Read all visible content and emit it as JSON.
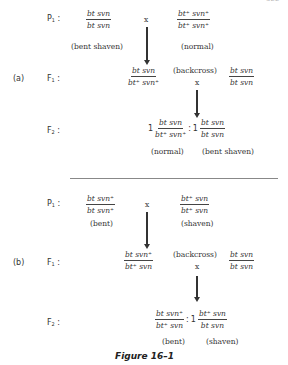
{
  "page_number": "322",
  "figure_caption": "Figure 16–1",
  "cross_a": {
    "label": "(a)",
    "P1": {
      "gen_label": "P",
      "gen_sub": "1",
      "left_parent": {
        "num": "bt svn",
        "den": "bt svn",
        "phenotype": "(bent shaven)"
      },
      "cross_symbol": "x",
      "right_parent": {
        "num": "bt⁺ svn⁺",
        "den": "bt⁺ svn⁺",
        "phenotype": "(normal)"
      }
    },
    "F1": {
      "gen_label": "F",
      "gen_sub": "1",
      "genotype": {
        "num": "bt  svn",
        "den": "bt⁺ svn⁺"
      },
      "backcross_label": "(backcross)",
      "cross_symbol": "x",
      "tester": {
        "num": "bt svn",
        "den": "bt svn"
      }
    },
    "F2": {
      "gen_label": "F",
      "gen_sub": "2",
      "ratio_left": "1",
      "left": {
        "num": "bt  svn",
        "den": "bt⁺ svn⁺",
        "phenotype": "(normal)"
      },
      "colon": ":",
      "ratio_right": "1",
      "right": {
        "num": "bt svn",
        "den": "bt svn",
        "phenotype": "(bent shaven)"
      }
    }
  },
  "cross_b": {
    "label": "(b)",
    "P1": {
      "gen_label": "P",
      "gen_sub": "1",
      "left_parent": {
        "num": "bt svn⁺",
        "den": "bt svn⁺",
        "phenotype": "(bent)"
      },
      "cross_symbol": "x",
      "right_parent": {
        "num": "bt⁺ svn",
        "den": "bt⁺ svn",
        "phenotype": "(shaven)"
      }
    },
    "F1": {
      "gen_label": "F",
      "gen_sub": "1",
      "genotype": {
        "num": "bt  svn⁺",
        "den": "bt⁺ svn"
      },
      "backcross_label": "(backcross)",
      "cross_symbol": "x",
      "tester": {
        "num": "bt svn",
        "den": "bt svn"
      }
    },
    "F2": {
      "gen_label": "F",
      "gen_sub": "2",
      "left": {
        "num": "bt  svn⁺",
        "den": "bt⁺ svn",
        "phenotype": "(bent)"
      },
      "colon": ":",
      "ratio_right": "1",
      "right": {
        "num": "bt⁺  svn",
        "den": "bt   svn",
        "phenotype": "(shaven)"
      }
    }
  }
}
